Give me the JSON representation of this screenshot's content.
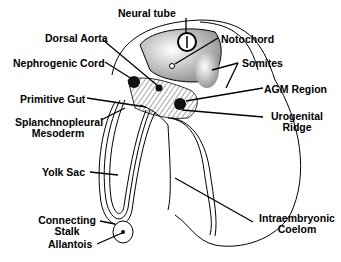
{
  "labels": {
    "neural_tube": "Neural tube",
    "notochord": "Notochord",
    "dorsal_aorta": "Dorsal Aorta",
    "nephrogenic_cord": "Nephrogenic Cord",
    "somites": "Somites",
    "agm_region": "AGM Region",
    "primitive_gut": "Primitive Gut",
    "splanchnopleural_1": "Splanchnopleural",
    "splanchnopleural_2": "Mesoderm",
    "urogenital_1": "Urogenital",
    "urogenital_2": "Ridge",
    "yolk_sac": "Yolk Sac",
    "connecting_1": "Connecting",
    "connecting_2": "Stalk",
    "allantois": "Allantois",
    "coelom_1": "Intraembryonic",
    "coelom_2": "Coelom"
  },
  "colors": {
    "ink": "#000000",
    "background": "#ffffff"
  }
}
